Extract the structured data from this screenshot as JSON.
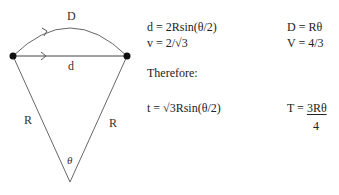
{
  "diagram": {
    "labels": {
      "arc": "D",
      "chord": "d",
      "left_radius": "R",
      "right_radius": "R",
      "angle": "θ"
    },
    "stroke_color": "#555555",
    "dot_color": "#111111"
  },
  "equations": {
    "left": [
      "d = 2Rsin(θ/2)",
      "v = 2/√3"
    ],
    "right": [
      "D = Rθ",
      "V = 4/3"
    ],
    "therefore": "Therefore:",
    "result_left": "t = √3Rsin(θ/2)",
    "result_right": {
      "prefix": "T = ",
      "numerator": "3Rθ",
      "denominator": "4"
    }
  }
}
